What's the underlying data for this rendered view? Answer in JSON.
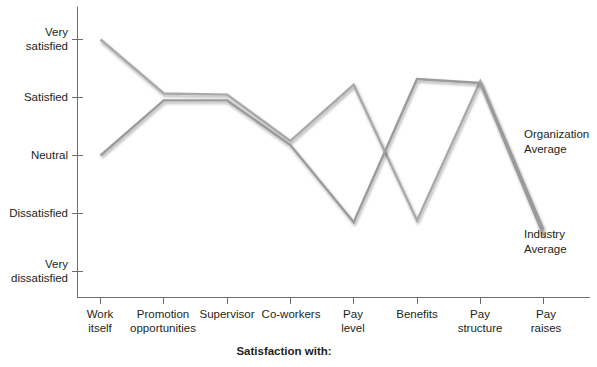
{
  "chart_data": {
    "type": "line",
    "title": "",
    "xlabel": "Satisfaction with:",
    "ylabel": "",
    "categories": [
      "Work itself",
      "Promotion opportunities",
      "Supervisor",
      "Co-workers",
      "Pay level",
      "Benefits",
      "Pay structure",
      "Pay raises"
    ],
    "ytick_labels": [
      "Very satisfied",
      "Satisfied",
      "Neutral",
      "Dissatisfied",
      "Very dissatisfied"
    ],
    "ylim": [
      1,
      5
    ],
    "ylevels": [
      5,
      4,
      3,
      2,
      1
    ],
    "grid": false,
    "legend_position": "right-inline",
    "series": [
      {
        "name": "Organization Average",
        "color": "#a9a9a9",
        "values": [
          5.0,
          4.07,
          4.05,
          3.25,
          4.22,
          1.88,
          4.28,
          1.72
        ]
      },
      {
        "name": "Industry Average",
        "color": "#9b9b9b",
        "values": [
          3.0,
          3.95,
          3.95,
          3.18,
          1.85,
          4.32,
          4.25,
          1.62
        ]
      }
    ]
  },
  "axis": {
    "x_title": "Satisfaction with:",
    "tick_labels_x": [
      [
        "Work",
        "itself"
      ],
      [
        "Promotion",
        "opportunities"
      ],
      [
        "Supervisor",
        ""
      ],
      [
        "Co-workers",
        ""
      ],
      [
        "Pay",
        "level"
      ],
      [
        "Benefits",
        ""
      ],
      [
        "Pay",
        "structure"
      ],
      [
        "Pay",
        "raises"
      ]
    ],
    "tick_labels_y": [
      [
        "Very",
        "satisfied"
      ],
      [
        "Satisfied",
        ""
      ],
      [
        "Neutral",
        ""
      ],
      [
        "Dissatisfied",
        ""
      ],
      [
        "Very",
        "dissatisfied"
      ]
    ]
  },
  "legend": {
    "organization": [
      "Organization",
      "Average"
    ],
    "industry": [
      "Industry",
      "Average"
    ]
  },
  "colors": {
    "axis": "#6d6e70",
    "text": "#231f20",
    "series_organization": "#a9a9a9",
    "series_industry": "#9b9b9b",
    "background": "#ffffff"
  }
}
